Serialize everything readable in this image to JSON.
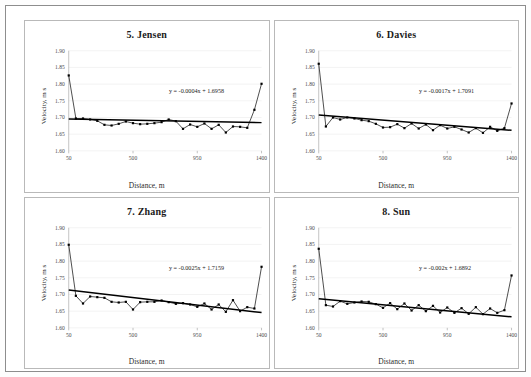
{
  "figure": {
    "axis": {
      "ylabel": "Velocity, m s",
      "xlabel": "Distance, m",
      "yticks": [
        "1.90",
        "1.85",
        "1.80",
        "1.75",
        "1.70",
        "1.65",
        "1.60"
      ],
      "xticks": [
        "50",
        "500",
        "950",
        "1400"
      ],
      "ylim": [
        1.6,
        1.9
      ],
      "xlim": [
        50,
        1400
      ]
    },
    "panels": [
      {
        "id": "panel-5-jensen",
        "title": "5. Jensen",
        "equation": "y = -0.0004x + 1.6958",
        "trend": {
          "slope": -0.0004,
          "intercept": 1.6958
        },
        "chart_data": {
          "type": "line",
          "title": "5. Jensen",
          "xlabel": "Distance, m",
          "ylabel": "Velocity, m s",
          "xlim": [
            50,
            1400
          ],
          "ylim": [
            1.6,
            1.9
          ],
          "grid": true,
          "legend": false,
          "annotation": "y = -0.0004x + 1.6958",
          "x": [
            50,
            100,
            150,
            200,
            250,
            300,
            350,
            400,
            450,
            500,
            550,
            600,
            650,
            700,
            750,
            800,
            850,
            900,
            950,
            1000,
            1050,
            1100,
            1150,
            1200,
            1250,
            1300,
            1350,
            1400
          ],
          "y": [
            1.826,
            1.697,
            1.697,
            1.694,
            1.69,
            1.678,
            1.676,
            1.681,
            1.688,
            1.683,
            1.68,
            1.681,
            1.683,
            1.686,
            1.694,
            1.689,
            1.666,
            1.679,
            1.672,
            1.682,
            1.666,
            1.678,
            1.655,
            1.673,
            1.672,
            1.669,
            1.723,
            1.801
          ]
        }
      },
      {
        "id": "panel-6-davies",
        "title": "6. Davies",
        "equation": "y = -0.0017x + 1.7091",
        "trend": {
          "slope": -0.0017,
          "intercept": 1.7091
        },
        "chart_data": {
          "type": "line",
          "title": "6. Davies",
          "xlabel": "Distance, m",
          "ylabel": "Velocity, m s",
          "xlim": [
            50,
            1400
          ],
          "ylim": [
            1.6,
            1.9
          ],
          "grid": true,
          "legend": false,
          "annotation": "y = -0.0017x + 1.7091",
          "x": [
            50,
            100,
            150,
            200,
            250,
            300,
            350,
            400,
            450,
            500,
            550,
            600,
            650,
            700,
            750,
            800,
            850,
            900,
            950,
            1000,
            1050,
            1100,
            1150,
            1200,
            1250,
            1300,
            1350,
            1400
          ],
          "y": [
            1.861,
            1.673,
            1.7,
            1.694,
            1.7,
            1.697,
            1.692,
            1.689,
            1.681,
            1.67,
            1.671,
            1.68,
            1.668,
            1.682,
            1.667,
            1.679,
            1.662,
            1.677,
            1.667,
            1.672,
            1.664,
            1.655,
            1.668,
            1.654,
            1.672,
            1.66,
            1.668,
            1.742
          ]
        }
      },
      {
        "id": "panel-7-zhang",
        "title": "7. Zhang",
        "equation": "y = -0.0025x + 1.7159",
        "trend": {
          "slope": -0.0025,
          "intercept": 1.7159
        },
        "chart_data": {
          "type": "line",
          "title": "7. Zhang",
          "xlabel": "Distance, m",
          "ylabel": "Velocity, m s",
          "xlim": [
            50,
            1400
          ],
          "ylim": [
            1.6,
            1.9
          ],
          "grid": true,
          "legend": false,
          "annotation": "y = -0.0025x + 1.7159",
          "x": [
            50,
            100,
            150,
            200,
            250,
            300,
            350,
            400,
            450,
            500,
            550,
            600,
            650,
            700,
            750,
            800,
            850,
            900,
            950,
            1000,
            1050,
            1100,
            1150,
            1200,
            1250,
            1300,
            1350,
            1400
          ],
          "y": [
            1.849,
            1.696,
            1.673,
            1.694,
            1.692,
            1.69,
            1.678,
            1.676,
            1.678,
            1.655,
            1.677,
            1.678,
            1.678,
            1.682,
            1.677,
            1.672,
            1.674,
            1.67,
            1.663,
            1.673,
            1.655,
            1.67,
            1.648,
            1.683,
            1.65,
            1.662,
            1.658,
            1.783
          ]
        }
      },
      {
        "id": "panel-8-sun",
        "title": "8. Sun",
        "equation": "y = -0.002x + 1.6892",
        "trend": {
          "slope": -0.002,
          "intercept": 1.6892
        },
        "chart_data": {
          "type": "line",
          "title": "8. Sun",
          "xlabel": "Distance, m",
          "ylabel": "Velocity, m s",
          "xlim": [
            50,
            1400
          ],
          "ylim": [
            1.6,
            1.9
          ],
          "grid": true,
          "legend": false,
          "annotation": "y = -0.002x + 1.6892",
          "x": [
            50,
            100,
            150,
            200,
            250,
            300,
            350,
            400,
            450,
            500,
            550,
            600,
            650,
            700,
            750,
            800,
            850,
            900,
            950,
            1000,
            1050,
            1100,
            1150,
            1200,
            1250,
            1300,
            1350,
            1400
          ],
          "y": [
            1.837,
            1.668,
            1.664,
            1.68,
            1.672,
            1.676,
            1.679,
            1.678,
            1.671,
            1.66,
            1.674,
            1.656,
            1.673,
            1.652,
            1.668,
            1.65,
            1.666,
            1.646,
            1.661,
            1.645,
            1.659,
            1.642,
            1.662,
            1.641,
            1.658,
            1.645,
            1.653,
            1.757
          ]
        }
      }
    ]
  }
}
